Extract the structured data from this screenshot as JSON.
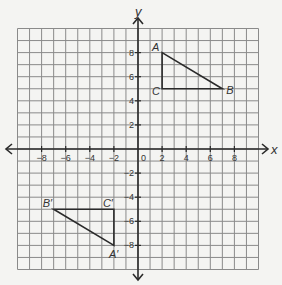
{
  "chart_data": {
    "type": "coordinate-plane",
    "xlabel": "x",
    "ylabel": "y",
    "xlim": [
      -10,
      10
    ],
    "ylim": [
      -10,
      10
    ],
    "grid": true,
    "grid_step": 1,
    "origin_label": "0",
    "x_ticks": [
      {
        "value": -8,
        "label": "−8"
      },
      {
        "value": -6,
        "label": "−6"
      },
      {
        "value": -4,
        "label": "−4"
      },
      {
        "value": -2,
        "label": "−2"
      },
      {
        "value": 2,
        "label": "2"
      },
      {
        "value": 4,
        "label": "4"
      },
      {
        "value": 6,
        "label": "6"
      },
      {
        "value": 8,
        "label": "8"
      }
    ],
    "y_ticks": [
      {
        "value": 8,
        "label": "8"
      },
      {
        "value": 6,
        "label": "6"
      },
      {
        "value": 4,
        "label": "4"
      },
      {
        "value": 2,
        "label": "2"
      },
      {
        "value": -2,
        "label": "−2"
      },
      {
        "value": -4,
        "label": "−4"
      },
      {
        "value": -6,
        "label": "−6"
      },
      {
        "value": -8,
        "label": "−8"
      }
    ],
    "shapes": [
      {
        "name": "triangle ABC",
        "vertices": [
          {
            "label": "A",
            "x": 2,
            "y": 8
          },
          {
            "label": "B",
            "x": 7,
            "y": 5
          },
          {
            "label": "C",
            "x": 2,
            "y": 5
          }
        ]
      },
      {
        "name": "triangle A'B'C'",
        "vertices": [
          {
            "label": "A′",
            "x": -2,
            "y": -8
          },
          {
            "label": "B′",
            "x": -7,
            "y": -5
          },
          {
            "label": "C′",
            "x": -2,
            "y": -5
          }
        ]
      }
    ]
  },
  "colors": {
    "background": "#f4f4f2",
    "grid": "#8a8a8a",
    "axis": "#2a2a2a",
    "shape": "#2a2a2a",
    "text": "#333333"
  }
}
